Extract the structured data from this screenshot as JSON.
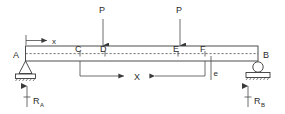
{
  "diagram": {
    "type": "beam-free-body-diagram",
    "beam": {
      "left_label": "A",
      "right_label": "B",
      "interior_labels": [
        "C",
        "D",
        "E",
        "F"
      ]
    },
    "loads": [
      {
        "label": "P",
        "applied_at": "D",
        "direction": "down"
      },
      {
        "label": "P",
        "applied_at": "E",
        "direction": "down"
      }
    ],
    "reactions": [
      {
        "label": "R",
        "subscript": "A",
        "at": "A",
        "direction": "up"
      },
      {
        "label": "R",
        "subscript": "B",
        "at": "B",
        "direction": "up"
      }
    ],
    "dimensions": [
      {
        "label": "x",
        "from": "A",
        "to": "open",
        "placement": "above-beam"
      },
      {
        "label": "X",
        "from": "C",
        "to": "F",
        "placement": "below-beam"
      },
      {
        "label": "e",
        "from": "F",
        "to": "offset",
        "placement": "below-beam"
      }
    ],
    "supports": [
      {
        "at": "A",
        "kind": "pin"
      },
      {
        "at": "B",
        "kind": "roller"
      }
    ],
    "colors": {
      "line": "#3a3a3a",
      "dashed_axis": "#555555",
      "text": "#2b2b2b",
      "background": "#ffffff"
    }
  }
}
